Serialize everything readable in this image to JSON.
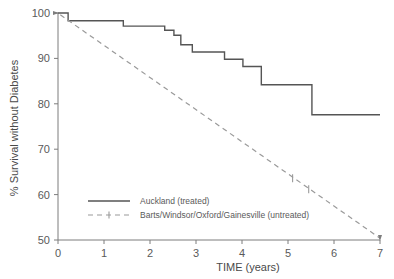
{
  "chart_data": {
    "type": "line",
    "title": "",
    "subtitle": "",
    "xlabel": "TIME (years)",
    "ylabel": "% Survival without Diabetes",
    "xlim": [
      0,
      7
    ],
    "ylim": [
      50,
      100
    ],
    "grid": false,
    "legend_position": "inside-lower-left",
    "x_ticks": [
      "0",
      "1",
      "2",
      "3",
      "4",
      "5",
      "6",
      "7"
    ],
    "y_ticks": [
      "50",
      "60",
      "70",
      "80",
      "90",
      "100"
    ],
    "series": [
      {
        "name": "Auckland (treated)",
        "style": "step-solid",
        "color": "#555555",
        "points": [
          [
            0.0,
            100.0
          ],
          [
            0.22,
            100.0
          ],
          [
            0.22,
            98.3
          ],
          [
            1.42,
            98.3
          ],
          [
            1.42,
            97.1
          ],
          [
            2.32,
            97.1
          ],
          [
            2.32,
            96.2
          ],
          [
            2.52,
            96.2
          ],
          [
            2.52,
            95.1
          ],
          [
            2.67,
            95.1
          ],
          [
            2.67,
            93.0
          ],
          [
            2.92,
            93.0
          ],
          [
            2.92,
            91.4
          ],
          [
            3.62,
            91.4
          ],
          [
            3.62,
            89.8
          ],
          [
            4.02,
            89.8
          ],
          [
            4.02,
            88.2
          ],
          [
            4.42,
            88.2
          ],
          [
            4.42,
            84.2
          ],
          [
            5.52,
            84.2
          ],
          [
            5.52,
            77.6
          ],
          [
            7.0,
            77.6
          ]
        ]
      },
      {
        "name": "Barts/Windsor/Oxford/Gainesville (untreated)",
        "style": "line-dashed",
        "color": "#9a9a9a",
        "points": [
          [
            0.05,
            99.6
          ],
          [
            7.0,
            50.4
          ]
        ],
        "censor_marks": [
          [
            5.1,
            63.6
          ],
          [
            5.45,
            61.2
          ]
        ]
      }
    ],
    "legend": [
      {
        "label": "Auckland (treated)",
        "style": "solid"
      },
      {
        "label": "Barts/Windsor/Oxford/Gainesville (untreated)",
        "style": "dashed-censored"
      }
    ]
  },
  "axes": {
    "x_title": "TIME (years)",
    "y_title": "% Survival without Diabetes"
  }
}
